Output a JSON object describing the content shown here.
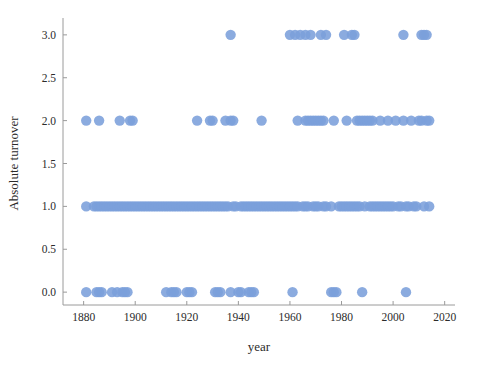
{
  "chart_data": {
    "type": "scatter",
    "title": "",
    "xlabel": "year",
    "ylabel": "Absolute turnover",
    "xlim": [
      1872,
      2024
    ],
    "ylim": [
      -0.15,
      3.15
    ],
    "xticks": [
      1880,
      1900,
      1920,
      1940,
      1960,
      1980,
      2000,
      2020
    ],
    "xtick_labels": [
      "1880",
      "1900",
      "1920",
      "1940",
      "1960",
      "1980",
      "2000",
      "2020"
    ],
    "yticks": [
      0.0,
      0.5,
      1.0,
      1.5,
      2.0,
      2.5,
      3.0
    ],
    "ytick_labels": [
      "0.0",
      "0.5",
      "1.0",
      "1.5",
      "2.0",
      "2.5",
      "3.0"
    ],
    "grid": false,
    "legend": false,
    "marker_color": "#7b9fdb",
    "marker_size": 5.2,
    "series": [
      {
        "name": "Absolute turnover",
        "x": [
          1881,
          1885,
          1886,
          1887,
          1891,
          1893,
          1895,
          1896,
          1897,
          1912,
          1914,
          1915,
          1916,
          1920,
          1921,
          1922,
          1931,
          1932,
          1933,
          1937,
          1940,
          1941,
          1944,
          1945,
          1946,
          1961,
          1976,
          1977,
          1978,
          1988,
          2005,
          1881,
          1886,
          1894,
          1898,
          1899,
          1924,
          1929,
          1930,
          1935,
          1937,
          1938,
          1949,
          1963,
          1966,
          1967,
          1968,
          1969,
          1970,
          1971,
          1972,
          1973,
          1977,
          1982,
          1986,
          1987,
          1988,
          1989,
          1990,
          1991,
          1992,
          1995,
          1998,
          2001,
          2004,
          2007,
          2010,
          2011,
          2013,
          2014,
          1937,
          1960,
          1962,
          1964,
          1966,
          1968,
          1972,
          1974,
          1981,
          1984,
          1985,
          2004,
          2011,
          2012,
          2013,
          1881,
          1884,
          1885,
          1886,
          1887,
          1888,
          1889,
          1890,
          1891,
          1892,
          1893,
          1894,
          1895,
          1896,
          1897,
          1898,
          1899,
          1900,
          1901,
          1902,
          1903,
          1904,
          1905,
          1906,
          1907,
          1908,
          1909,
          1910,
          1911,
          1912,
          1913,
          1914,
          1915,
          1916,
          1917,
          1918,
          1919,
          1920,
          1921,
          1922,
          1923,
          1924,
          1925,
          1926,
          1927,
          1928,
          1929,
          1930,
          1931,
          1932,
          1933,
          1934,
          1935,
          1936,
          1938,
          1939,
          1941,
          1942,
          1943,
          1944,
          1945,
          1946,
          1947,
          1948,
          1949,
          1950,
          1951,
          1952,
          1953,
          1954,
          1955,
          1956,
          1957,
          1958,
          1959,
          1960,
          1961,
          1962,
          1963,
          1965,
          1966,
          1967,
          1969,
          1970,
          1971,
          1973,
          1974,
          1976,
          1979,
          1980,
          1981,
          1982,
          1983,
          1984,
          1985,
          1986,
          1987,
          1989,
          1991,
          1992,
          1993,
          1994,
          1995,
          1996,
          1997,
          1998,
          1999,
          2000,
          2002,
          2003,
          2005,
          2006,
          2008,
          2009,
          2012,
          2014
        ],
        "y": [
          0,
          0,
          0,
          0,
          0,
          0,
          0,
          0,
          0,
          0,
          0,
          0,
          0,
          0,
          0,
          0,
          0,
          0,
          0,
          0,
          0,
          0,
          0,
          0,
          0,
          0,
          0,
          0,
          0,
          0,
          0,
          2,
          2,
          2,
          2,
          2,
          2,
          2,
          2,
          2,
          2,
          2,
          2,
          2,
          2,
          2,
          2,
          2,
          2,
          2,
          2,
          2,
          2,
          2,
          2,
          2,
          2,
          2,
          2,
          2,
          2,
          2,
          2,
          2,
          2,
          2,
          2,
          2,
          2,
          2,
          3,
          3,
          3,
          3,
          3,
          3,
          3,
          3,
          3,
          3,
          3,
          3,
          3,
          3,
          3,
          1,
          1,
          1,
          1,
          1,
          1,
          1,
          1,
          1,
          1,
          1,
          1,
          1,
          1,
          1,
          1,
          1,
          1,
          1,
          1,
          1,
          1,
          1,
          1,
          1,
          1,
          1,
          1,
          1,
          1,
          1,
          1,
          1,
          1,
          1,
          1,
          1,
          1,
          1,
          1,
          1,
          1,
          1,
          1,
          1,
          1,
          1,
          1,
          1,
          1,
          1,
          1,
          1,
          1,
          1,
          1,
          1,
          1,
          1,
          1,
          1,
          1,
          1,
          1,
          1,
          1,
          1,
          1,
          1,
          1,
          1,
          1,
          1,
          1,
          1,
          1,
          1,
          1,
          1,
          1,
          1,
          1,
          1,
          1,
          1,
          1,
          1,
          1,
          1,
          1,
          1,
          1,
          1,
          1,
          1,
          1,
          1,
          1,
          1,
          1,
          1,
          1,
          1,
          1,
          1,
          1,
          1,
          1,
          1,
          1,
          1,
          1,
          1,
          1,
          1,
          1
        ]
      }
    ]
  },
  "axes": {
    "x_title": "year",
    "y_title": "Absolute turnover"
  }
}
